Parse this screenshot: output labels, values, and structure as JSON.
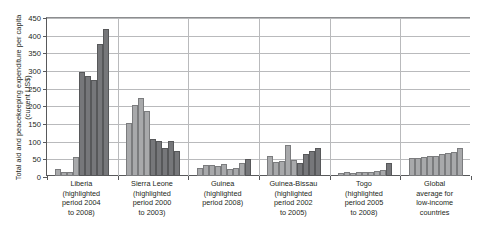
{
  "chart_data": {
    "type": "bar",
    "title": "",
    "xlabel": "",
    "ylabel": "Total aid and peacekeeping expenditure per capita (current US$)",
    "ylim": [
      0,
      450
    ],
    "yticks": [
      0,
      50,
      100,
      150,
      200,
      250,
      300,
      350,
      400,
      450
    ],
    "grid": true,
    "legend": "none",
    "colors": {
      "bar_normal": "#a8a9ab",
      "bar_highlighted": "#76777a",
      "axis": "#58595b",
      "gridline": "#b9babc"
    },
    "groups": [
      {
        "name": "Liberia",
        "label_lines": [
          "Liberia",
          "(highlighted",
          "period 2004",
          "to 2008)"
        ],
        "highlight_period": "2004 to 2008",
        "values": [
          20,
          10,
          12,
          55,
          293,
          283,
          273,
          375,
          415
        ],
        "highlighted": [
          false,
          false,
          false,
          false,
          true,
          true,
          true,
          true,
          true
        ]
      },
      {
        "name": "Sierra Leone",
        "label_lines": [
          "Sierra Leone",
          "(highlighted",
          "period 2000",
          "to 2003)"
        ],
        "highlight_period": "2000 to 2003",
        "values": [
          150,
          202,
          220,
          185,
          105,
          98,
          78,
          100,
          72
        ],
        "highlighted": [
          false,
          false,
          false,
          false,
          true,
          true,
          true,
          true,
          true
        ]
      },
      {
        "name": "Guinea",
        "label_lines": [
          "Guinea",
          "(highlighted",
          "period 2008)"
        ],
        "highlight_period": "2008",
        "values": [
          24,
          32,
          30,
          28,
          34,
          20,
          24,
          36,
          48
        ],
        "highlighted": [
          false,
          false,
          false,
          false,
          false,
          false,
          false,
          false,
          true
        ]
      },
      {
        "name": "Guinea-Bissau",
        "label_lines": [
          "Guinea-Bissau",
          "(highlighted",
          "period 2002",
          "to 2005)"
        ],
        "highlight_period": "2002 to 2005",
        "values": [
          58,
          40,
          42,
          88,
          44,
          38,
          62,
          70,
          78
        ],
        "highlighted": [
          false,
          false,
          false,
          false,
          false,
          true,
          true,
          true,
          true
        ]
      },
      {
        "name": "Togo",
        "label_lines": [
          "Togo",
          "(highlighted",
          "period 2005",
          "to 2008)"
        ],
        "highlight_period": "2005 to 2008",
        "values": [
          8,
          10,
          9,
          10,
          12,
          10,
          14,
          18,
          36
        ],
        "highlighted": [
          false,
          false,
          false,
          false,
          false,
          false,
          false,
          false,
          true
        ]
      },
      {
        "name": "Global average for low-income countries",
        "label_lines": [
          "Global",
          "average for",
          "low-income",
          "countries"
        ],
        "highlight_period": "",
        "values": [
          50,
          52,
          54,
          56,
          58,
          62,
          66,
          68,
          80
        ],
        "highlighted": [
          false,
          false,
          false,
          false,
          false,
          false,
          false,
          false,
          false
        ]
      }
    ]
  }
}
